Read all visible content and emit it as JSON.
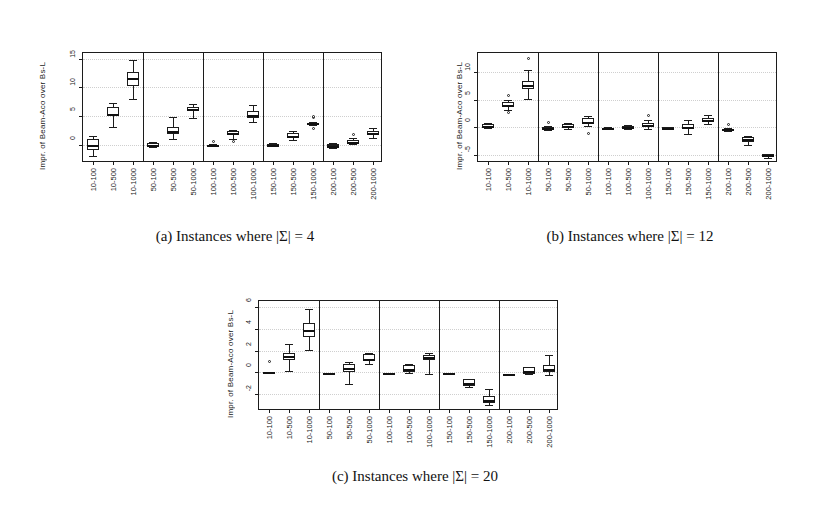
{
  "figure": {
    "ylabel_text": "Impr. of Beam-Aco over Bs-L",
    "group_separator_after": [
      3,
      6,
      9,
      12
    ],
    "categories": [
      "10-100",
      "10-500",
      "10-1000",
      "50-100",
      "50-500",
      "50-1000",
      "100-100",
      "100-500",
      "100-1000",
      "150-100",
      "150-500",
      "150-1000",
      "200-100",
      "200-500",
      "200-1000"
    ]
  },
  "captions": {
    "a": "(a) Instances where |Σ| = 4",
    "b": "(b) Instances where |Σ| = 12",
    "c": "(c) Instances where |Σ| = 20"
  },
  "chart_data": [
    {
      "type": "box",
      "id": "a",
      "title": "(a) Instances where |Σ| = 4",
      "xlabel": "",
      "ylabel": "Impr. of Beam-Aco over Bs-L",
      "ylim": [
        -3.2,
        16.0
      ],
      "yticks": [
        0,
        5,
        10,
        15
      ],
      "ytick_labels": [
        "0",
        "5",
        "10",
        "15"
      ],
      "grid": true,
      "categories": [
        "10-100",
        "10-500",
        "10-1000",
        "50-100",
        "50-500",
        "50-1000",
        "100-100",
        "100-500",
        "100-1000",
        "150-100",
        "150-500",
        "150-1000",
        "200-100",
        "200-500",
        "200-1000"
      ],
      "boxes": [
        {
          "category": "10-100",
          "min": -1.9,
          "q1": -0.9,
          "median": 0.0,
          "q3": 1.0,
          "max": 1.5,
          "outliers": []
        },
        {
          "category": "10-500",
          "min": 3.0,
          "q1": 5.0,
          "median": 5.3,
          "q3": 6.6,
          "max": 7.2,
          "outliers": []
        },
        {
          "category": "10-1000",
          "min": 8.0,
          "q1": 10.2,
          "median": 11.6,
          "q3": 12.6,
          "max": 14.7,
          "outliers": []
        },
        {
          "category": "50-100",
          "min": -0.4,
          "q1": -0.3,
          "median": 0.0,
          "q3": 0.3,
          "max": 0.4,
          "outliers": []
        },
        {
          "category": "50-500",
          "min": 1.0,
          "q1": 1.8,
          "median": 2.3,
          "q3": 3.0,
          "max": 4.9,
          "outliers": []
        },
        {
          "category": "50-1000",
          "min": 4.6,
          "q1": 5.9,
          "median": 6.3,
          "q3": 6.6,
          "max": 7.1,
          "outliers": []
        },
        {
          "category": "100-100",
          "min": -0.2,
          "q1": -0.1,
          "median": -0.1,
          "q3": 0.0,
          "max": 0.1,
          "outliers": [
            0.6
          ]
        },
        {
          "category": "100-500",
          "min": 1.0,
          "q1": 1.7,
          "median": 2.1,
          "q3": 2.4,
          "max": 2.6,
          "outliers": [
            0.55
          ]
        },
        {
          "category": "100-1000",
          "min": 4.0,
          "q1": 4.6,
          "median": 5.1,
          "q3": 5.9,
          "max": 7.0,
          "outliers": []
        },
        {
          "category": "150-100",
          "min": -0.3,
          "q1": -0.2,
          "median": -0.05,
          "q3": 0.2,
          "max": 0.3,
          "outliers": []
        },
        {
          "category": "150-500",
          "min": 0.8,
          "q1": 1.3,
          "median": 1.6,
          "q3": 2.0,
          "max": 2.3,
          "outliers": []
        },
        {
          "category": "150-1000",
          "min": 3.5,
          "q1": 3.6,
          "median": 3.7,
          "q3": 3.8,
          "max": 3.9,
          "outliers": [
            4.7,
            5.0,
            2.9
          ]
        },
        {
          "category": "200-100",
          "min": -0.5,
          "q1": -0.3,
          "median": -0.15,
          "q3": 0.2,
          "max": 0.35,
          "outliers": []
        },
        {
          "category": "200-500",
          "min": 0.1,
          "q1": 0.3,
          "median": 0.5,
          "q3": 0.9,
          "max": 1.1,
          "outliers": [
            1.7
          ]
        },
        {
          "category": "200-1000",
          "min": 1.2,
          "q1": 1.7,
          "median": 2.0,
          "q3": 2.4,
          "max": 2.9,
          "outliers": []
        }
      ]
    },
    {
      "type": "box",
      "id": "b",
      "title": "(b) Instances where |Σ| = 12",
      "xlabel": "",
      "ylabel": "Impr. of Beam-Aco over Bs-L",
      "ylim": [
        -6.5,
        13.5
      ],
      "yticks": [
        -5,
        0,
        5,
        10
      ],
      "ytick_labels": [
        "-5",
        "0",
        "5",
        "10"
      ],
      "grid": true,
      "categories": [
        "10-100",
        "10-500",
        "10-1000",
        "50-100",
        "50-500",
        "50-1000",
        "100-100",
        "100-500",
        "100-1000",
        "150-100",
        "150-500",
        "150-1000",
        "200-100",
        "200-500",
        "200-1000"
      ],
      "boxes": [
        {
          "category": "10-100",
          "min": -0.2,
          "q1": 0.0,
          "median": 0.3,
          "q3": 0.6,
          "max": 0.8,
          "outliers": []
        },
        {
          "category": "10-500",
          "min": 3.1,
          "q1": 3.7,
          "median": 4.1,
          "q3": 4.6,
          "max": 4.9,
          "outliers": [
            2.6,
            5.8
          ]
        },
        {
          "category": "10-1000",
          "min": 5.2,
          "q1": 6.9,
          "median": 7.6,
          "q3": 8.4,
          "max": 10.4,
          "outliers": [
            12.5
          ]
        },
        {
          "category": "50-100",
          "min": -0.5,
          "q1": -0.3,
          "median": -0.1,
          "q3": 0.1,
          "max": 0.2,
          "outliers": [
            0.9
          ]
        },
        {
          "category": "50-500",
          "min": -0.3,
          "q1": 0.0,
          "median": 0.2,
          "q3": 0.6,
          "max": 0.8,
          "outliers": []
        },
        {
          "category": "50-1000",
          "min": 0.2,
          "q1": 0.6,
          "median": 1.0,
          "q3": 1.6,
          "max": 2.0,
          "outliers": [
            -1.1
          ]
        },
        {
          "category": "100-100",
          "min": -0.4,
          "q1": -0.3,
          "median": -0.2,
          "q3": -0.1,
          "max": 0.0,
          "outliers": []
        },
        {
          "category": "100-500",
          "min": -0.4,
          "q1": -0.2,
          "median": 0.0,
          "q3": 0.3,
          "max": 0.5,
          "outliers": []
        },
        {
          "category": "100-1000",
          "min": -0.3,
          "q1": 0.1,
          "median": 0.4,
          "q3": 0.8,
          "max": 1.3,
          "outliers": [
            2.2
          ]
        },
        {
          "category": "150-100",
          "min": -0.4,
          "q1": -0.2,
          "median": -0.1,
          "q3": 0.0,
          "max": 0.1,
          "outliers": []
        },
        {
          "category": "150-500",
          "min": -1.3,
          "q1": -0.3,
          "median": 0.1,
          "q3": 0.6,
          "max": 1.4,
          "outliers": []
        },
        {
          "category": "150-1000",
          "min": 0.6,
          "q1": 1.0,
          "median": 1.4,
          "q3": 1.7,
          "max": 2.2,
          "outliers": []
        },
        {
          "category": "200-100",
          "min": -0.7,
          "q1": -0.5,
          "median": -0.4,
          "q3": -0.3,
          "max": -0.2,
          "outliers": [
            0.5
          ]
        },
        {
          "category": "200-500",
          "min": -3.2,
          "q1": -2.6,
          "median": -2.2,
          "q3": -1.8,
          "max": -1.6,
          "outliers": []
        },
        {
          "category": "200-1000",
          "min": -5.6,
          "q1": -5.3,
          "median": -5.1,
          "q3": -4.9,
          "max": -4.8,
          "outliers": []
        }
      ]
    },
    {
      "type": "box",
      "id": "c",
      "title": "(c) Instances where |Σ| = 20",
      "xlabel": "",
      "ylabel": "Impr. of Beam-Aco over Bs-L",
      "ylim": [
        -3.6,
        6.6
      ],
      "yticks": [
        -2,
        0,
        2,
        4,
        6
      ],
      "ytick_labels": [
        "-2",
        "0",
        "2",
        "4",
        "6"
      ],
      "grid": true,
      "categories": [
        "10-100",
        "10-500",
        "10-1000",
        "50-100",
        "50-500",
        "50-1000",
        "100-100",
        "100-500",
        "100-1000",
        "150-100",
        "150-500",
        "150-1000",
        "200-100",
        "200-500",
        "200-1000"
      ],
      "boxes": [
        {
          "category": "10-100",
          "min": 0.0,
          "q1": 0.0,
          "median": 0.0,
          "q3": 0.0,
          "max": 0.0,
          "outliers": [
            1.0
          ]
        },
        {
          "category": "10-500",
          "min": 0.1,
          "q1": 1.1,
          "median": 1.5,
          "q3": 1.8,
          "max": 2.6,
          "outliers": []
        },
        {
          "category": "10-1000",
          "min": 2.1,
          "q1": 3.3,
          "median": 3.9,
          "q3": 4.6,
          "max": 5.9,
          "outliers": []
        },
        {
          "category": "50-100",
          "min": -0.05,
          "q1": -0.05,
          "median": -0.05,
          "q3": -0.05,
          "max": -0.05,
          "outliers": []
        },
        {
          "category": "50-500",
          "min": -1.1,
          "q1": 0.0,
          "median": 0.4,
          "q3": 0.8,
          "max": 0.9,
          "outliers": []
        },
        {
          "category": "50-1000",
          "min": 0.8,
          "q1": 1.0,
          "median": 1.2,
          "q3": 1.7,
          "max": 1.8,
          "outliers": []
        },
        {
          "category": "100-100",
          "min": -0.1,
          "q1": -0.1,
          "median": -0.1,
          "q3": -0.1,
          "max": -0.1,
          "outliers": []
        },
        {
          "category": "100-500",
          "min": -0.1,
          "q1": 0.0,
          "median": 0.3,
          "q3": 0.7,
          "max": 0.8,
          "outliers": []
        },
        {
          "category": "100-1000",
          "min": -0.2,
          "q1": 1.1,
          "median": 1.4,
          "q3": 1.6,
          "max": 1.8,
          "outliers": []
        },
        {
          "category": "150-100",
          "min": -0.1,
          "q1": -0.1,
          "median": -0.1,
          "q3": -0.1,
          "max": -0.1,
          "outliers": []
        },
        {
          "category": "150-500",
          "min": -1.4,
          "q1": -1.3,
          "median": -1.0,
          "q3": -0.6,
          "max": -0.6,
          "outliers": []
        },
        {
          "category": "150-1000",
          "min": -3.0,
          "q1": -2.9,
          "median": -2.6,
          "q3": -2.2,
          "max": -1.6,
          "outliers": []
        },
        {
          "category": "200-100",
          "min": -0.15,
          "q1": -0.15,
          "median": -0.15,
          "q3": -0.15,
          "max": -0.15,
          "outliers": []
        },
        {
          "category": "200-500",
          "min": -0.2,
          "q1": -0.2,
          "median": 0.1,
          "q3": 0.5,
          "max": 0.5,
          "outliers": []
        },
        {
          "category": "200-1000",
          "min": -0.3,
          "q1": 0.0,
          "median": 0.3,
          "q3": 0.7,
          "max": 1.6,
          "outliers": []
        }
      ]
    }
  ]
}
